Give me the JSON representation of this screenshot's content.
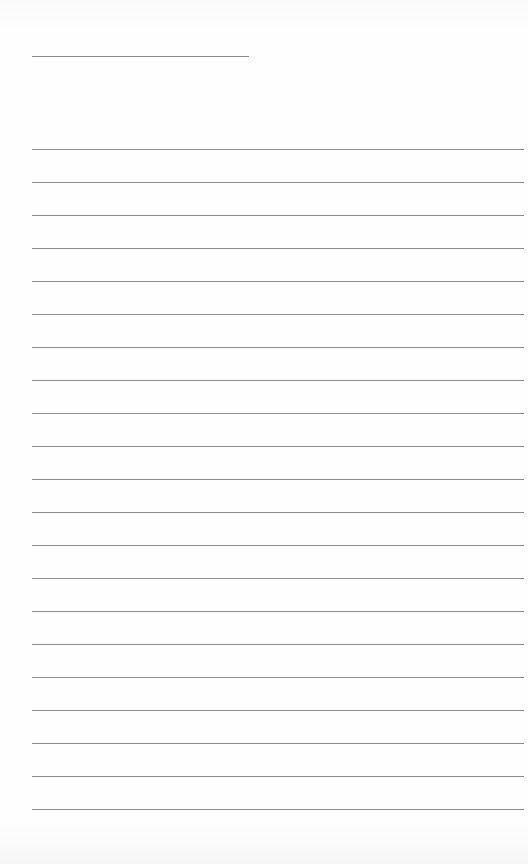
{
  "document": {
    "type": "lined-paper",
    "header_field": {
      "label": "",
      "value": ""
    },
    "ruled_line_count": 21,
    "lines": [
      "",
      "",
      "",
      "",
      "",
      "",
      "",
      "",
      "",
      "",
      "",
      "",
      "",
      "",
      "",
      "",
      "",
      "",
      "",
      "",
      ""
    ],
    "colors": {
      "paper": "#fdfdfd",
      "rule": "#8c8c8c"
    }
  }
}
